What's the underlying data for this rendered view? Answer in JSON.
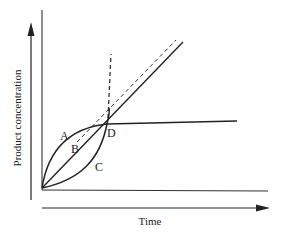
{
  "diagram": {
    "type": "kinetics-curves",
    "x_axis_label": "Time",
    "y_axis_label": "Product concentration",
    "curve_labels": {
      "A": "A",
      "B": "B",
      "C": "C",
      "D": "D"
    },
    "colors": {
      "line": "#222222",
      "background": "#ffffff"
    },
    "elements": [
      {
        "id": "A",
        "description": "concave-down curve rising from origin, passing through D then leveling off (plateau)"
      },
      {
        "id": "B",
        "description": "straight line from origin through D continuing upward"
      },
      {
        "id": "C",
        "description": "concave-up curve rising from origin through D and continuing steeply upward"
      },
      {
        "id": "D",
        "description": "common intersection point of curves A, B and C"
      },
      {
        "id": "dashed-tangent",
        "description": "dashed line tangent to curve A, parallel to line B"
      },
      {
        "id": "dashed-vertical",
        "description": "dashed near-vertical extension above D"
      }
    ]
  }
}
